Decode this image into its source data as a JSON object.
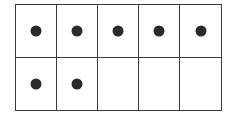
{
  "ten_frame": {
    "rows": 2,
    "columns": 5,
    "filled_count": 7,
    "cells": [
      {
        "filled": true
      },
      {
        "filled": true
      },
      {
        "filled": true
      },
      {
        "filled": true
      },
      {
        "filled": true
      },
      {
        "filled": true
      },
      {
        "filled": true
      },
      {
        "filled": false
      },
      {
        "filled": false
      },
      {
        "filled": false
      }
    ],
    "colors": {
      "line": "#3a3a3a",
      "dot": "#2a2a2a",
      "background": "#ffffff"
    }
  }
}
